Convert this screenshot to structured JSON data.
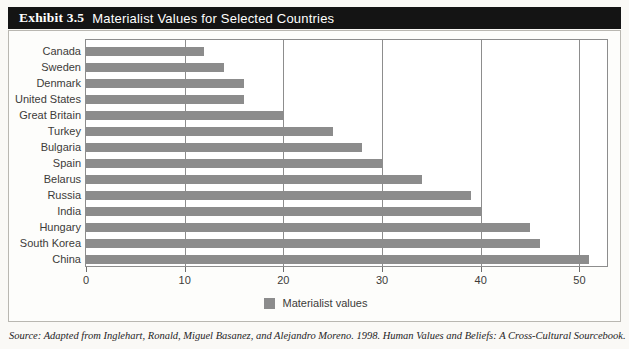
{
  "exhibit": {
    "number_label": "Exhibit 3.5",
    "title": "Materialist Values for Selected Countries",
    "source_note": "Source: Adapted from Inglehart, Ronald, Miguel Basanez, and Alejandro Moreno. 1998. Human Values and Beliefs: A Cross-Cultural Sourcebook."
  },
  "colors": {
    "bar": "#8c8c8c",
    "banner": "#141414",
    "banner_text": "#ffffff",
    "axis": "#8d8d8d",
    "label_text": "#3c3b39"
  },
  "legend": {
    "position": "bottom-center",
    "entries": [
      {
        "label": "Materialist values",
        "color": "#8c8c8c"
      }
    ]
  },
  "chart_data": {
    "type": "bar",
    "orientation": "horizontal",
    "title": "Materialist Values for Selected Countries",
    "xlabel": "",
    "ylabel": "",
    "xlim": [
      0,
      53
    ],
    "grid": true,
    "gridlines_x": [
      0,
      10,
      20,
      30,
      40,
      50
    ],
    "xticks": [
      0,
      10,
      20,
      30,
      40,
      50
    ],
    "xtick_labels": [
      "0",
      "10",
      "20",
      "30",
      "40",
      "50"
    ],
    "categories": [
      "Canada",
      "Sweden",
      "Denmark",
      "United States",
      "Great Britain",
      "Turkey",
      "Bulgaria",
      "Spain",
      "Belarus",
      "Russia",
      "India",
      "Hungary",
      "South Korea",
      "China"
    ],
    "series": [
      {
        "name": "Materialist values",
        "color": "#8c8c8c",
        "values": [
          12,
          14,
          16,
          16,
          20,
          25,
          28,
          30,
          34,
          39,
          40,
          45,
          46,
          51
        ]
      }
    ]
  }
}
